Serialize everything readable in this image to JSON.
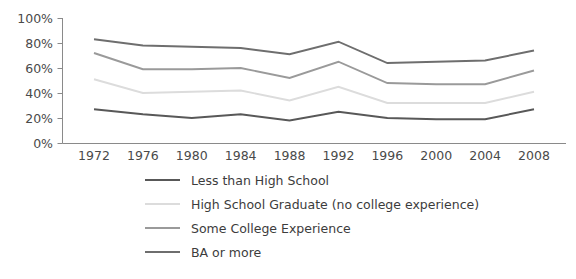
{
  "chart_data": {
    "type": "line",
    "title": "",
    "subtitle": "",
    "xlabel": "",
    "ylabel": "",
    "grid": false,
    "legend_position": "bottom",
    "categories": [
      "1972",
      "1976",
      "1980",
      "1984",
      "1988",
      "1992",
      "1996",
      "2000",
      "2004",
      "2008"
    ],
    "x": [
      1972,
      1976,
      1980,
      1984,
      1988,
      1992,
      1996,
      2000,
      2004,
      2008
    ],
    "ylim": [
      0,
      100
    ],
    "yticks": [
      0,
      20,
      40,
      60,
      80,
      100
    ],
    "ytick_labels": [
      "0%",
      "20%",
      "40%",
      "60%",
      "80%",
      "100%"
    ],
    "series": [
      {
        "name": "Less than High School",
        "color": "#585858",
        "values": [
          27,
          23,
          20,
          23,
          18,
          25,
          20,
          19,
          19,
          27
        ]
      },
      {
        "name": "High School Graduate (no college experience)",
        "color": "#dcdcdc",
        "values": [
          51,
          40,
          41,
          42,
          34,
          45,
          32,
          32,
          32,
          41
        ]
      },
      {
        "name": "Some College Experience",
        "color": "#9a9a9a",
        "values": [
          72,
          59,
          59,
          60,
          52,
          65,
          48,
          47,
          47,
          58
        ]
      },
      {
        "name": "BA or more",
        "color": "#6e6e6e",
        "values": [
          83,
          78,
          77,
          76,
          71,
          81,
          64,
          65,
          66,
          74
        ]
      }
    ]
  },
  "legend": {
    "items": [
      {
        "label": "Less than High School",
        "color": "#585858"
      },
      {
        "label": "High School Graduate (no college experience)",
        "color": "#dcdcdc"
      },
      {
        "label": "Some College Experience",
        "color": "#9a9a9a"
      },
      {
        "label": "BA or more",
        "color": "#6e6e6e"
      }
    ]
  },
  "axes": {
    "axis_color": "#8a8a8a",
    "label_color": "#4a4a4a"
  }
}
